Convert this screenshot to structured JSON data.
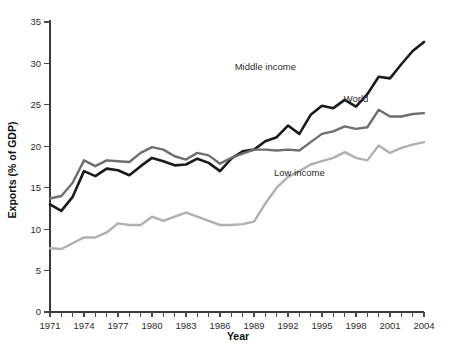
{
  "chart_data": {
    "type": "line",
    "title": "",
    "xlabel": "Year",
    "ylabel": "Exports (% of GDP)",
    "xlim": [
      1971,
      2004
    ],
    "ylim": [
      0,
      35
    ],
    "y_ticks": [
      0,
      5,
      10,
      15,
      20,
      25,
      30,
      35
    ],
    "x_ticks": [
      1971,
      1972,
      1973,
      1974,
      1975,
      1976,
      1977,
      1978,
      1979,
      1980,
      1981,
      1982,
      1983,
      1984,
      1985,
      1986,
      1987,
      1988,
      1989,
      1990,
      1991,
      1992,
      1993,
      1994,
      1995,
      1996,
      1997,
      1998,
      1999,
      2000,
      2001,
      2002,
      2003,
      2004
    ],
    "x_tick_labels": [
      "1971",
      "",
      "",
      "1974",
      "",
      "",
      "1977",
      "",
      "",
      "1980",
      "",
      "",
      "1983",
      "",
      "",
      "1986",
      "",
      "",
      "1989",
      "",
      "",
      "1992",
      "",
      "",
      "1995",
      "",
      "",
      "1998",
      "",
      "",
      "2001",
      "",
      "",
      "2004"
    ],
    "grid": false,
    "legend_position": "inline-annotations",
    "x": [
      1971,
      1972,
      1973,
      1974,
      1975,
      1976,
      1977,
      1978,
      1979,
      1980,
      1981,
      1982,
      1983,
      1984,
      1985,
      1986,
      1987,
      1988,
      1989,
      1990,
      1991,
      1992,
      1993,
      1994,
      1995,
      1996,
      1997,
      1998,
      1999,
      2000,
      2001,
      2002,
      2003,
      2004
    ],
    "series": [
      {
        "name": "Middle income",
        "color": "#1a1a1a",
        "width": 2.6,
        "label_x": 1990,
        "label_y": 29.2,
        "values": [
          13.0,
          12.2,
          13.9,
          17.0,
          16.4,
          17.3,
          17.1,
          16.5,
          17.6,
          18.6,
          18.2,
          17.7,
          17.8,
          18.5,
          18.0,
          17.0,
          18.5,
          19.4,
          19.6,
          20.6,
          21.1,
          22.5,
          21.5,
          23.8,
          24.9,
          24.6,
          25.6,
          24.8,
          26.3,
          28.4,
          28.2,
          29.9,
          31.5,
          32.6
        ]
      },
      {
        "name": "World",
        "color": "#6e6e6e",
        "width": 2.4,
        "label_x": 1998,
        "label_y": 25.3,
        "values": [
          13.7,
          14.0,
          15.6,
          18.3,
          17.6,
          18.3,
          18.2,
          18.1,
          19.2,
          19.9,
          19.6,
          18.8,
          18.4,
          19.2,
          18.9,
          17.9,
          18.6,
          19.1,
          19.6,
          19.6,
          19.5,
          19.6,
          19.5,
          20.5,
          21.5,
          21.8,
          22.4,
          22.1,
          22.3,
          24.4,
          23.6,
          23.6,
          23.9,
          24.0
        ]
      },
      {
        "name": "Low income",
        "color": "#b0b0b0",
        "width": 2.4,
        "label_x": 1993,
        "label_y": 16.4,
        "values": [
          7.7,
          7.6,
          8.3,
          9.0,
          9.0,
          9.6,
          10.7,
          10.5,
          10.5,
          11.5,
          11.0,
          11.5,
          12.0,
          11.5,
          11.0,
          10.5,
          10.5,
          10.6,
          10.9,
          13.1,
          15.0,
          16.3,
          17.0,
          17.8,
          18.2,
          18.6,
          19.3,
          18.6,
          18.3,
          20.1,
          19.2,
          19.8,
          20.2,
          20.5
        ]
      }
    ]
  }
}
